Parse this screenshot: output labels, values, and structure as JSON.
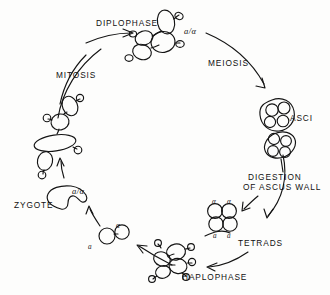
{
  "diagram": {
    "stroke_color": "#141414",
    "background_color": "#fdfdfc",
    "stage_labels": [
      {
        "id": "diplophase",
        "text": "DIPLOPHASE",
        "x": 96,
        "y": 18
      },
      {
        "id": "meiosis",
        "text": "MEIOSIS",
        "x": 208,
        "y": 58
      },
      {
        "id": "asci",
        "text": "ASCI",
        "x": 290,
        "y": 113
      },
      {
        "id": "tetrads",
        "text": "TETRADS",
        "x": 238,
        "y": 238
      },
      {
        "id": "haplophase",
        "text": "HAPLOPHASE",
        "x": 182,
        "y": 272
      },
      {
        "id": "zygote",
        "text": "ZYGOTE",
        "x": 14,
        "y": 200
      },
      {
        "id": "mitosis",
        "text": "MITOSIS",
        "x": 56,
        "y": 70
      }
    ],
    "multiline_labels": [
      {
        "id": "digestion-of-ascus-wall",
        "line1": "DIGESTION",
        "line2": "OF ASCUS WALL",
        "x": 248,
        "y": 172
      }
    ],
    "genotype_labels": [
      {
        "id": "diploid-genotype-diplophase",
        "text": "a/α",
        "x": 184,
        "y": 26,
        "size": "normal"
      },
      {
        "id": "diploid-genotype-zygote",
        "text": "a/α",
        "x": 72,
        "y": 186,
        "size": "normal"
      },
      {
        "id": "tetrad-spore-alpha-1",
        "text": "α",
        "x": 212,
        "y": 198,
        "size": "small"
      },
      {
        "id": "tetrad-spore-alpha-2",
        "text": "α",
        "x": 227,
        "y": 198,
        "size": "small"
      },
      {
        "id": "tetrad-spore-a-1",
        "text": "a",
        "x": 213,
        "y": 232,
        "size": "small"
      },
      {
        "id": "tetrad-spore-a-2",
        "text": "a",
        "x": 227,
        "y": 232,
        "size": "small"
      },
      {
        "id": "mating-cell-alpha",
        "text": "α",
        "x": 116,
        "y": 222,
        "size": "small"
      },
      {
        "id": "mating-cell-a",
        "text": "a",
        "x": 88,
        "y": 243,
        "size": "small"
      }
    ]
  }
}
